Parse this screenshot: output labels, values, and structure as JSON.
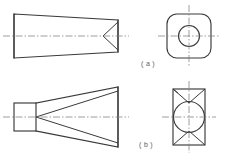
{
  "figure": {
    "type": "engineering-orthographic-drawing",
    "background_color": "#ffffff",
    "line_color": "#3a3a3a",
    "centerline_color": "#7d7d7d",
    "width": 226,
    "height": 163
  },
  "captions": {
    "a": "( a )",
    "b": "( b )"
  },
  "views": {
    "a_front": {
      "name": "tapered-wedge-with-v-notch",
      "description": "Front view: symmetric tapered block, tall at left, narrow at right, with a V-shaped notch cut into the right end",
      "left_height": 38,
      "right_height": 24,
      "length": 104
    },
    "a_end": {
      "name": "rounded-square-with-bore",
      "description": "End view: rounded square outline with a concentric circular bore and crosshair centerlines",
      "square_size": 44,
      "corner_radius": 10,
      "bore_diameter": 21
    },
    "b_front": {
      "name": "tapered-wedge-with-converging-lines",
      "description": "Front view: small rectangle at left, long tapering body widening to the right, with two internal diagonals converging to a point on the axis at the rectangle's right edge",
      "block_width": 22,
      "block_height": 28,
      "right_height": 60,
      "length": 104
    },
    "b_end": {
      "name": "rectangle-with-inscribed-circle-and-diagonals",
      "description": "End view: vertical rectangle with an inscribed circle touching the side edges, X diagonals in the upper and lower regions, and crosshair centerlines",
      "rect_width": 32,
      "rect_height": 56,
      "circle_diameter": 31
    }
  }
}
